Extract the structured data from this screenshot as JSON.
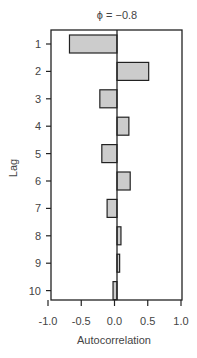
{
  "chart_data": {
    "type": "bar",
    "orientation": "horizontal",
    "title": "ϕ = −0.8",
    "xlabel": "Autocorrelation",
    "ylabel": "Lag",
    "categories": [
      "1",
      "2",
      "3",
      "4",
      "5",
      "6",
      "7",
      "8",
      "9",
      "10"
    ],
    "values": [
      -0.72,
      0.48,
      -0.26,
      0.18,
      -0.23,
      0.2,
      -0.15,
      0.06,
      0.04,
      -0.06
    ],
    "xlim": [
      -1.0,
      1.0
    ],
    "xticks": [
      "-1.0",
      "-0.5",
      "0.0",
      "0.5",
      "1.0"
    ],
    "grid": false,
    "bar_fill": "#cccccc",
    "bar_stroke": "#222222"
  }
}
